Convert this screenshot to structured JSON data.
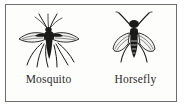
{
  "figure": {
    "panel_name": "insect-comparison-figure",
    "background_color": "#fdfdfc",
    "border_color": "#6e6e6e",
    "ink_color": "#1a1a1a",
    "specimens": [
      {
        "label": "Mosquito",
        "icon_name": "mosquito-illustration",
        "view": "dorsal-oblique",
        "features": "spread narrow wings, long dangling legs, slender proboscis, plumed antennae"
      },
      {
        "label": "Horsefly",
        "icon_name": "horsefly-illustration",
        "view": "dorsal",
        "features": "stout dark segmented body, broad head, wings held at sides, six legs"
      }
    ]
  }
}
